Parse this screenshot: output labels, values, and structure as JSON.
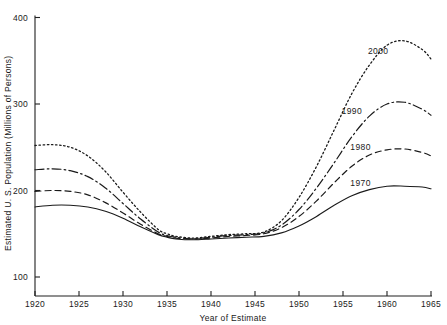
{
  "chart_data": {
    "type": "line",
    "title": "",
    "xlabel": "Year of Estimate",
    "ylabel": "Estimated U. S. Population (Millions of Persons)",
    "xlim": [
      1920,
      1965
    ],
    "ylim": [
      100,
      400
    ],
    "xticks": [
      1920,
      1925,
      1930,
      1935,
      1940,
      1945,
      1950,
      1955,
      1960,
      1965
    ],
    "xticklabels": [
      "1920",
      "1925",
      "1930",
      "1935",
      "1940",
      "1945",
      "1950",
      "1955",
      "1960",
      "1965"
    ],
    "yticks": [
      100,
      200,
      300,
      400
    ],
    "yticklabels": [
      "100",
      "200",
      "300",
      "400"
    ],
    "grid": false,
    "legend_position": "inline-right",
    "x": [
      1920,
      1922,
      1924,
      1926,
      1928,
      1930,
      1932,
      1934,
      1935,
      1936,
      1938,
      1940,
      1942,
      1944,
      1946,
      1948,
      1950,
      1952,
      1954,
      1956,
      1958,
      1960,
      1962,
      1964,
      1965
    ],
    "series": [
      {
        "name": "2000",
        "label": "2000",
        "style": "dotted",
        "label_x": 1959,
        "label_y": 358,
        "values": [
          252,
          253,
          250,
          240,
          222,
          198,
          175,
          155,
          150,
          147,
          145,
          147,
          149,
          150,
          152,
          165,
          192,
          228,
          270,
          312,
          345,
          368,
          373,
          363,
          352
        ]
      },
      {
        "name": "1990",
        "label": "1990",
        "style": "dash-dot",
        "label_x": 1956,
        "label_y": 289,
        "values": [
          224,
          225,
          223,
          216,
          203,
          185,
          167,
          152,
          148,
          146,
          144,
          146,
          148,
          149,
          151,
          160,
          178,
          203,
          232,
          262,
          286,
          300,
          302,
          294,
          287
        ]
      },
      {
        "name": "1980",
        "label": "1980",
        "style": "dashed",
        "label_x": 1957,
        "label_y": 247,
        "values": [
          199,
          200,
          199,
          195,
          186,
          174,
          161,
          150,
          147,
          145,
          144,
          145,
          147,
          148,
          150,
          157,
          170,
          188,
          209,
          228,
          241,
          247,
          248,
          244,
          240
        ]
      },
      {
        "name": "1970",
        "label": "1970",
        "style": "solid",
        "label_x": 1957,
        "label_y": 205,
        "values": [
          181,
          183,
          183,
          181,
          176,
          168,
          158,
          149,
          146,
          144,
          143,
          144,
          145,
          146,
          147,
          151,
          159,
          170,
          183,
          194,
          201,
          205,
          205,
          204,
          202
        ]
      }
    ]
  }
}
